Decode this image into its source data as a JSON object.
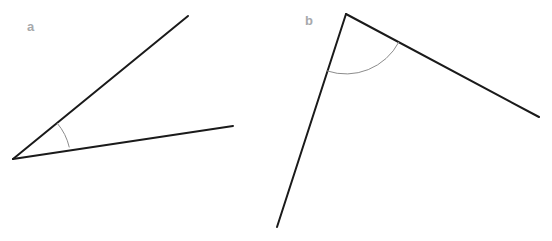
{
  "figure": {
    "background_color": "#ffffff",
    "width": 552,
    "height": 241,
    "ray_color": "#1a1a1a",
    "ray_width": 2,
    "arc_color": "#8c8c8c",
    "arc_width": 1,
    "label_color": "#a7a9ac"
  },
  "angles": [
    {
      "label": "a",
      "label_position": {
        "x": 27,
        "y": 20
      },
      "vertex": {
        "x": 13,
        "y": 159
      },
      "rays": [
        {
          "name": "ray-a-upper",
          "from": {
            "x": 13,
            "y": 159
          },
          "to": {
            "x": 188,
            "y": 16
          }
        },
        {
          "name": "ray-a-lower",
          "from": {
            "x": 13,
            "y": 159
          },
          "to": {
            "x": 233,
            "y": 126
          }
        }
      ],
      "arc": {
        "radius": 57,
        "path": "M 57.1 123.1 A 57 57 0 0 1 69.3 147.4"
      },
      "measure_degrees": 30,
      "type": "acute"
    },
    {
      "label": "b",
      "label_position": {
        "x": 305,
        "y": 14
      },
      "vertex": {
        "x": 346,
        "y": 14
      },
      "rays": [
        {
          "name": "ray-b-left",
          "from": {
            "x": 346,
            "y": 14
          },
          "to": {
            "x": 277,
            "y": 227
          }
        },
        {
          "name": "ray-b-right",
          "from": {
            "x": 346,
            "y": 14
          },
          "to": {
            "x": 539,
            "y": 117
          }
        }
      ],
      "arc": {
        "radius": 60,
        "path": "M 327.0 70.9 A 60 60 0 0 0 398.9 42.0"
      },
      "measure_degrees": 100,
      "type": "obtuse"
    }
  ],
  "chart_data": {
    "type": "diagram",
    "items": [
      {
        "label": "a",
        "measure_degrees": 30,
        "classification": "acute"
      },
      {
        "label": "b",
        "measure_degrees": 100,
        "classification": "obtuse"
      }
    ]
  }
}
